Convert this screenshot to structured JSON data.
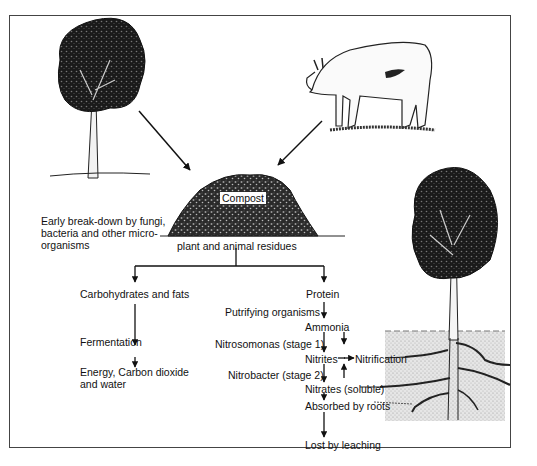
{
  "diagram": {
    "type": "compost_nutrient_cycle",
    "sources": [
      {
        "name": "tree",
        "icon": "tree-icon"
      },
      {
        "name": "cow",
        "icon": "cow-icon"
      }
    ],
    "compost": {
      "label": "Compost",
      "sublabel": "plant and animal residues",
      "side_note": "Early break-down by fungi, bacteria and other micro-organisms"
    },
    "left_branch": {
      "nodes": [
        "Carbohydrates and fats",
        "Fermentation",
        "Energy, Carbon dioxide and water"
      ]
    },
    "right_branch": {
      "nodes": [
        "Protein",
        "Ammonia",
        "Nitrites",
        "Nitrates (soluble)",
        "Absorbed by roots",
        "Lost by leaching"
      ],
      "process_labels": [
        "Putrifying organisms",
        "Nitrosomonas (stage 1)",
        "Nitrobacter (stage 2)"
      ],
      "side_label": "Nitrification"
    },
    "colors": {
      "line": "#111111",
      "border": "#444444",
      "soil": "#d9d9d9",
      "foliage": "#1a1a1a"
    }
  }
}
